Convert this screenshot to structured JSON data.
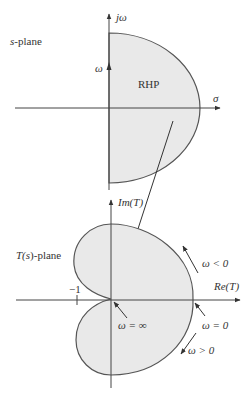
{
  "colors": {
    "fill": "#e9e9e9",
    "stroke": "#555555",
    "text": "#333333"
  },
  "s_plane": {
    "plane_label_var": "s",
    "plane_label_suffix": "-plane",
    "vertical_axis": "jω",
    "horizontal_axis": "σ",
    "omega_label": "ω",
    "region_label": "RHP"
  },
  "t_plane": {
    "plane_label_prefix": "T(",
    "plane_label_var": "s",
    "plane_label_suffix": ")-plane",
    "vertical_axis": "Im(T)",
    "horizontal_axis": "Re(T)",
    "tick_label": "−1",
    "annotations": {
      "omega_neg": "ω < 0",
      "omega_pos": "ω > 0",
      "omega_zero": "ω = 0",
      "omega_inf": "ω = ∞"
    }
  }
}
